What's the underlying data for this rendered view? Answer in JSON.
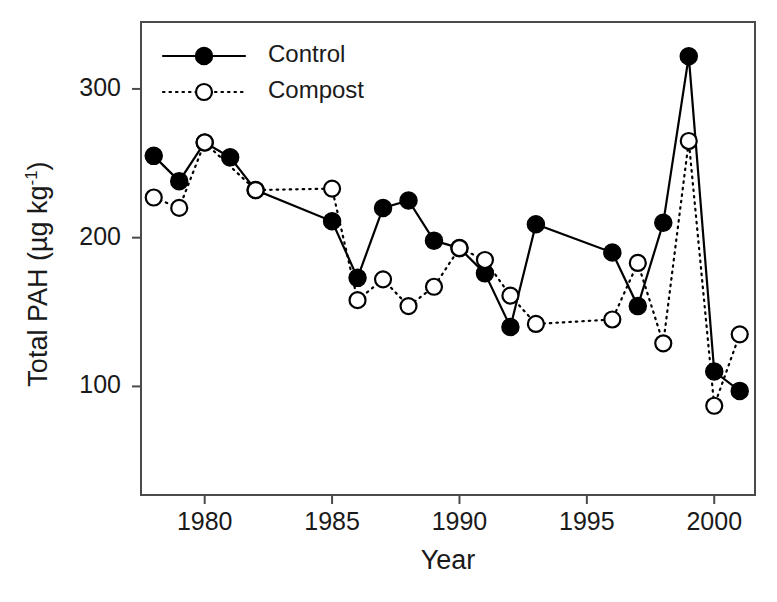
{
  "chart_data": {
    "type": "line",
    "title": "",
    "subtitle": "",
    "xlabel": "Year",
    "ylabel": "Total PAH (µg kg",
    "ylabel_sup": "-1",
    "ylabel_suffix": ")",
    "ylabel_full": "Total PAH (µg kg⁻¹)",
    "xlim": [
      1977.5,
      2001.6
    ],
    "ylim": [
      27,
      345
    ],
    "xticks": [
      1980,
      1985,
      1990,
      1995,
      2000
    ],
    "xtick_labels": [
      "1980",
      "1985",
      "1990",
      "1995",
      "2000"
    ],
    "yticks": [
      100,
      200,
      300
    ],
    "ytick_labels": [
      "100",
      "200",
      "300"
    ],
    "grid": false,
    "legend_position": "top-left-inside",
    "x": [
      1978,
      1979,
      1980,
      1981,
      1982,
      1985,
      1986,
      1987,
      1988,
      1989,
      1990,
      1991,
      1992,
      1993,
      1996,
      1997,
      1998,
      1999,
      2000,
      2001
    ],
    "series": [
      {
        "name": "Control",
        "color": "#000000",
        "marker": "filled-circle",
        "linestyle": "solid",
        "x": [
          1978,
          1979,
          1980,
          1981,
          1982,
          1985,
          1986,
          1987,
          1988,
          1989,
          1990,
          1991,
          1992,
          1993,
          1996,
          1997,
          1998,
          1999,
          2000,
          2001
        ],
        "values": [
          255,
          238,
          264,
          254,
          232,
          211,
          173,
          220,
          225,
          198,
          193,
          176,
          140,
          209,
          190,
          154,
          210,
          322,
          110,
          97
        ]
      },
      {
        "name": "Compost",
        "color": "#000000",
        "marker": "open-circle",
        "linestyle": "dotted",
        "x": [
          1978,
          1979,
          1980,
          1982,
          1985,
          1986,
          1987,
          1988,
          1989,
          1990,
          1991,
          1992,
          1993,
          1996,
          1997,
          1998,
          1999,
          2000,
          2001
        ],
        "values": [
          227,
          220,
          264,
          232,
          233,
          158,
          172,
          154,
          167,
          193,
          185,
          161,
          142,
          145,
          183,
          129,
          265,
          87,
          135
        ]
      }
    ]
  },
  "legend": {
    "items": [
      {
        "label": "Control",
        "marker": "filled-circle",
        "linestyle": "solid"
      },
      {
        "label": "Compost",
        "marker": "open-circle",
        "linestyle": "dotted"
      }
    ]
  },
  "colors": {
    "ink": "#1a1a1a",
    "axis": "#4a4a4a",
    "background": "#ffffff"
  }
}
